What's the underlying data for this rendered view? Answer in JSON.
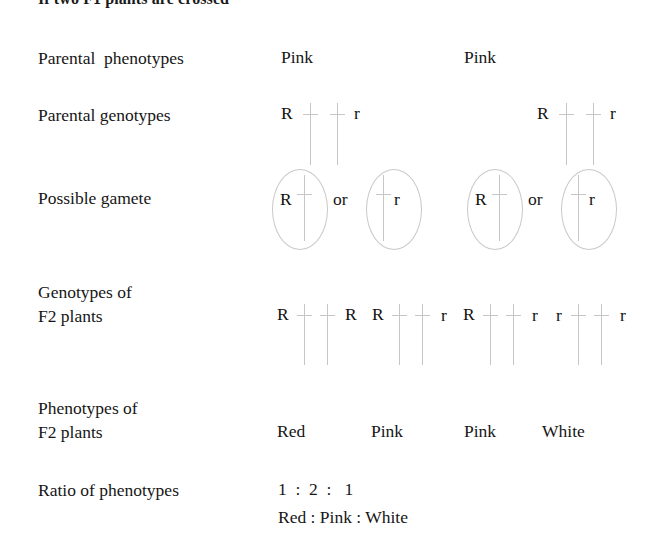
{
  "heading": "If two F1 plants are crossed",
  "rows": {
    "parental_phenotypes": {
      "label": "Parental  phenotypes",
      "values": [
        "Pink",
        "Pink"
      ]
    },
    "parental_genotypes": {
      "label": "Parental genotypes",
      "parents": [
        {
          "left_allele": "R",
          "right_allele": "r"
        },
        {
          "left_allele": "R",
          "right_allele": "r"
        }
      ]
    },
    "possible_gamete": {
      "label": "Possible gamete",
      "conjunction": "or",
      "parents": [
        {
          "gametes": [
            {
              "allele": "R",
              "allele_side": "left"
            },
            {
              "allele": "r",
              "allele_side": "right"
            }
          ]
        },
        {
          "gametes": [
            {
              "allele": "R",
              "allele_side": "left"
            },
            {
              "allele": "r",
              "allele_side": "right"
            }
          ]
        }
      ]
    },
    "f2_genotypes": {
      "label_line1": "Genotypes of",
      "label_line2": "F2 plants",
      "genotypes": [
        {
          "left_allele": "R",
          "right_allele": "R"
        },
        {
          "left_allele": "R",
          "right_allele": "r"
        },
        {
          "left_allele": "R",
          "right_allele": "r"
        },
        {
          "left_allele": "r",
          "right_allele": "r"
        }
      ]
    },
    "f2_phenotypes": {
      "label_line1": "Phenotypes of",
      "label_line2": "F2 plants",
      "values": [
        "Red",
        "Pink",
        "Pink",
        "White"
      ]
    },
    "ratio": {
      "label": "Ratio of phenotypes",
      "numbers": "1  :  2  :   1",
      "names": "Red : Pink : White"
    }
  },
  "colors": {
    "text": "#161616",
    "chromosome": "#c6c6c6",
    "ellipse": "#c9c9c9",
    "background": "#ffffff"
  }
}
